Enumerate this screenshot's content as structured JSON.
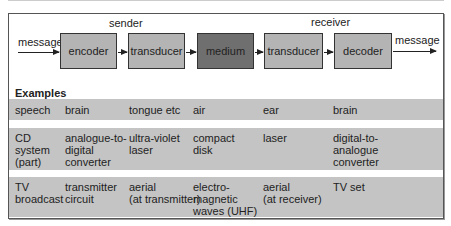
{
  "diagram": {
    "labels": {
      "sender": "sender",
      "receiver": "receiver",
      "message_in": "message",
      "message_out": "message"
    },
    "blocks": [
      {
        "id": "encoder",
        "label": "encoder"
      },
      {
        "id": "transducer-send",
        "label": "transducer"
      },
      {
        "id": "medium",
        "label": "medium"
      },
      {
        "id": "transducer-receive",
        "label": "transducer"
      },
      {
        "id": "decoder",
        "label": "decoder"
      }
    ],
    "colors": {
      "block": "#b4b4b4",
      "medium": "#6f6f6f",
      "row": "#c4c4c4"
    }
  },
  "examples": {
    "title": "Examples",
    "rows": [
      [
        "speech",
        "brain",
        "tongue etc",
        "air",
        "ear",
        "brain"
      ],
      [
        "CD\nsystem\n(part)",
        "analogue-to-\ndigital\nconverter",
        "ultra-violet\nlaser",
        "compact\ndisk",
        "laser",
        "digital-to-\nanalogue\nconverter"
      ],
      [
        "TV\nbroadcast",
        "transmitter\ncircuit",
        "aerial\n(at transmitter)",
        "electro-\nmagnetic\nwaves (UHF)",
        "aerial\n(at receiver)",
        "TV set"
      ]
    ]
  }
}
